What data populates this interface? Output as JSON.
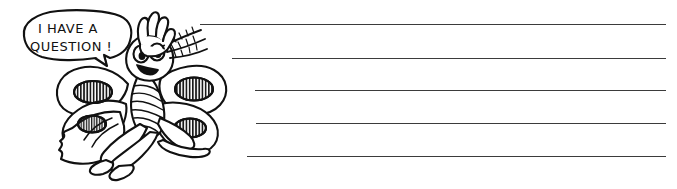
{
  "page": {
    "background_color": "#ffffff",
    "ink_color": "#111111",
    "line_color": "#3b3b3b",
    "width": 677,
    "height": 189
  },
  "speech_bubble": {
    "name": "speech-bubble",
    "line_1": "I HAVE A",
    "line_2": "QUESTION !",
    "full_text": "I HAVE A QUESTION !",
    "tail_direction": "down-right"
  },
  "character": {
    "name": "butterfly-cartoon",
    "description": "smiling cartoon butterfly sitting with one hand raised",
    "features": [
      "raised-hand",
      "feathery-antennae",
      "two-eyes",
      "open-smile",
      "four-wings",
      "striped-body",
      "crossed-legs"
    ],
    "wing_spot_count": 4,
    "wing_spot_fill": "vertical-stripes"
  },
  "writing_lines": {
    "name": "writing-lines",
    "count": 5,
    "right_edge": 666,
    "lines": [
      {
        "label": "writing-line-1",
        "y": 24,
        "x_start": 200,
        "value": ""
      },
      {
        "label": "writing-line-2",
        "y": 58,
        "x_start": 232,
        "value": ""
      },
      {
        "label": "writing-line-3",
        "y": 90,
        "x_start": 255,
        "value": ""
      },
      {
        "label": "writing-line-4",
        "y": 123,
        "x_start": 256,
        "value": ""
      },
      {
        "label": "writing-line-5",
        "y": 156,
        "x_start": 247,
        "value": ""
      }
    ]
  }
}
